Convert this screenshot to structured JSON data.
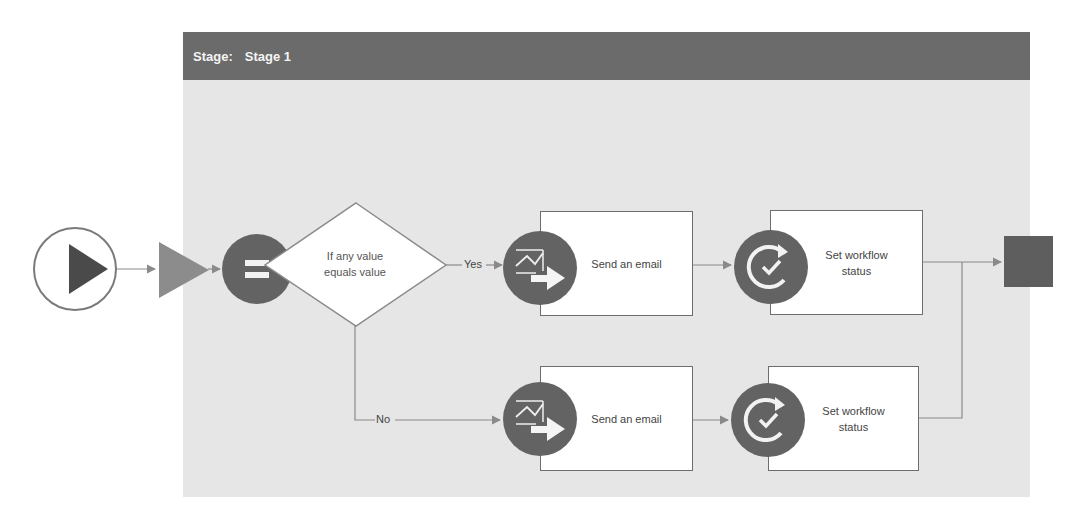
{
  "stage": {
    "label": "Stage:",
    "name": "Stage 1"
  },
  "nodes": {
    "start": {
      "type": "start",
      "icon": "play-icon"
    },
    "stage_entry": {
      "type": "stage-entry",
      "icon": "triangle-icon"
    },
    "condition": {
      "icon": "equals-icon",
      "text_line1": "If any value",
      "text_line2": "equals value"
    },
    "yes_branch": {
      "label": "Yes",
      "email_action": {
        "icon": "send-email-icon",
        "label": "Send an email"
      },
      "status_action": {
        "icon": "set-status-icon",
        "label_line1": "Set workflow",
        "label_line2": "status"
      }
    },
    "no_branch": {
      "label": "No",
      "email_action": {
        "icon": "send-email-icon",
        "label": "Send an email"
      },
      "status_action": {
        "icon": "set-status-icon",
        "label_line1": "Set workflow",
        "label_line2": "status"
      }
    },
    "end": {
      "type": "end",
      "icon": "stop-square-icon"
    }
  },
  "colors": {
    "stage_header": "#6b6b6b",
    "stage_body": "#e6e6e6",
    "icon_circle": "#636363",
    "connector": "#8a8a8a",
    "box_border": "#6d6d6d",
    "end_square": "#5e5e5e",
    "entry_triangle": "#8c8c8c",
    "start_triangle": "#4a4a4a"
  }
}
